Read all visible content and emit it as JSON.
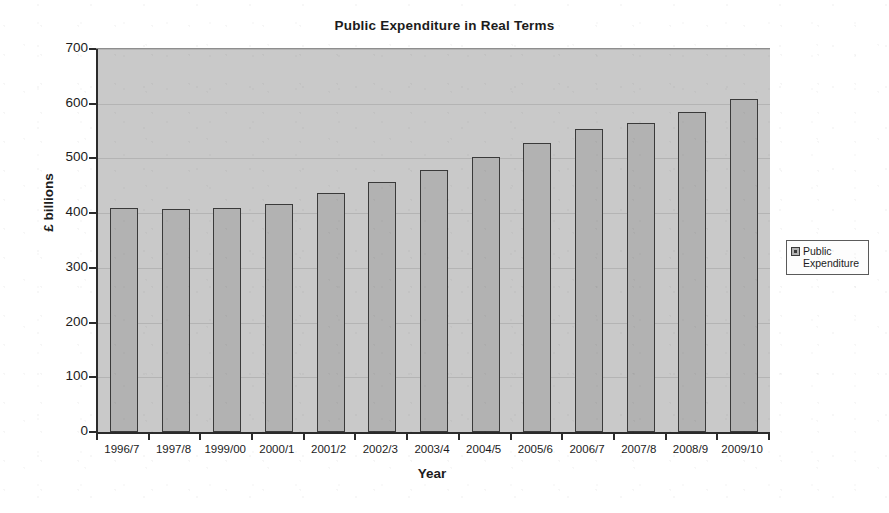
{
  "chart_data": {
    "type": "bar",
    "title": "Public Expenditure in Real Terms",
    "xlabel": "Year",
    "ylabel": "£ billions",
    "ylim": [
      0,
      700
    ],
    "ytick_step": 100,
    "yticks": [
      "0",
      "100",
      "200",
      "300",
      "400",
      "500",
      "600",
      "700"
    ],
    "grid": true,
    "grid_axis": "y",
    "legend_position": "right",
    "legend": [
      "Public Expenditure"
    ],
    "categories": [
      "1996/7",
      "1997/8",
      "1999/00",
      "2000/1",
      "2001/2",
      "2002/3",
      "2003/4",
      "2004/5",
      "2005/6",
      "2006/7",
      "2007/8",
      "2008/9",
      "2009/10"
    ],
    "series": [
      {
        "name": "Public Expenditure",
        "color": "#b2b2b2",
        "values": [
          410,
          408,
          410,
          416,
          437,
          457,
          479,
          503,
          528,
          553,
          565,
          585,
          608
        ]
      }
    ]
  },
  "legend_box": {
    "label_line_1": "Public",
    "label_line_2": "Expenditure",
    "swatch_name": "public-expenditure-swatch"
  }
}
